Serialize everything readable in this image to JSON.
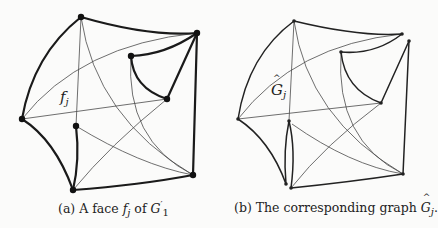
{
  "panels": [
    {
      "id": "a",
      "label_main": "f",
      "label_sub": "j",
      "caption_prefix": "(a) A face ",
      "caption_math": "f",
      "caption_math_sub": "j",
      "caption_mid": " of ",
      "caption_graph": "G",
      "caption_graph_sup": "′",
      "caption_graph_sub": "1"
    },
    {
      "id": "b",
      "label_main": "G",
      "label_sub": "j",
      "caption_prefix": "(b) The corresponding graph ",
      "caption_math": "G",
      "caption_math_sub": "j",
      "caption_suffix": "."
    }
  ],
  "colors": {
    "background": "#fbfbfa",
    "stroke": "#1a1a1a",
    "thin_stroke": "#4a4a4a"
  }
}
